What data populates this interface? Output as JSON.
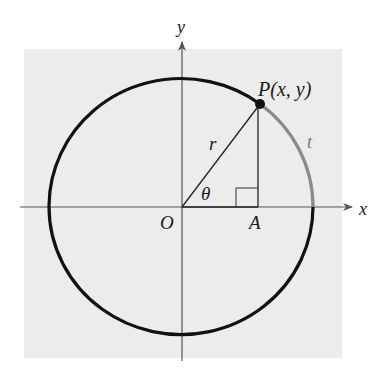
{
  "diagram": {
    "type": "unit-circle-trigonometry",
    "colors": {
      "background": "#ffffff",
      "panel": "#ececec",
      "circle": "#111111",
      "arc_t": "#8a8a8a",
      "axes": "#555555",
      "lines": "#222222"
    },
    "labels": {
      "y_axis": "y",
      "x_axis": "x",
      "point": "P(x, y)",
      "radius": "r",
      "angle": "θ",
      "origin": "O",
      "foot": "A",
      "arc": "t"
    }
  }
}
